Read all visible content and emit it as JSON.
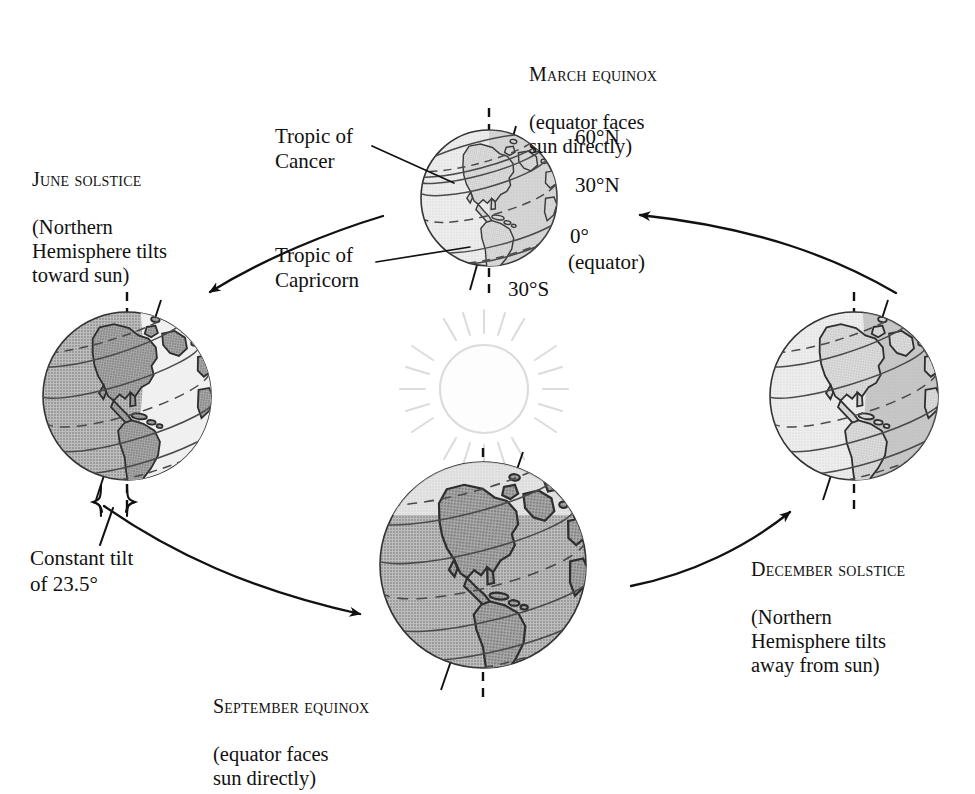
{
  "diagram": {
    "title_semantic": "earth-seasons-orbit-diagram",
    "center_body": "sun",
    "orbit_direction": "counterclockwise",
    "colors": {
      "ink": "#111111",
      "sun_outline": "#d8d8d8",
      "globe_light": "#e4e4e4",
      "globe_mid": "#c9c9c9",
      "globe_dark": "#9c9c9c",
      "land_light": "#d2d2d2",
      "land_dark": "#8f8f8f",
      "background": "#ffffff"
    }
  },
  "labels": {
    "march": {
      "heading": "March equinox",
      "detail": "(equator faces\nsun directly)"
    },
    "june": {
      "heading": "June solstice",
      "detail": "(Northern\nHemisphere tilts\ntoward sun)"
    },
    "september": {
      "heading": "September equinox",
      "detail": "(equator faces\nsun directly)"
    },
    "december": {
      "heading": "December solstice",
      "detail": "(Northern\nHemisphere tilts\naway from sun)"
    },
    "tropic_cancer": "Tropic of\nCancer",
    "tropic_capricorn": "Tropic of\nCapricorn",
    "tilt": "Constant tilt\nof 23.5°"
  },
  "latitude_ticks": [
    {
      "key": "n60",
      "text": "60°N"
    },
    {
      "key": "n30",
      "text": "30°N"
    },
    {
      "key": "eq",
      "text": "0°"
    },
    {
      "key": "eq_note",
      "text": "(equator)"
    },
    {
      "key": "s30",
      "text": "30°S"
    }
  ],
  "globes": [
    {
      "key": "march",
      "label": "March equinox globe",
      "lit_side": "both-even",
      "axis_tilt_deg": 23.5
    },
    {
      "key": "june",
      "label": "June solstice globe",
      "lit_side": "right",
      "axis_tilt_deg": 23.5
    },
    {
      "key": "september",
      "label": "September equinox globe",
      "lit_side": "both-even",
      "axis_tilt_deg": 23.5
    },
    {
      "key": "december",
      "label": "December solstice globe",
      "lit_side": "left",
      "axis_tilt_deg": 23.5
    }
  ],
  "orbit_arrows": [
    {
      "key": "march-to-june",
      "from": "March equinox",
      "to": "June solstice"
    },
    {
      "key": "june-to-september",
      "from": "June solstice",
      "to": "September equinox"
    },
    {
      "key": "september-to-december",
      "from": "September equinox",
      "to": "December solstice"
    },
    {
      "key": "december-to-march",
      "from": "December solstice",
      "to": "March equinox"
    }
  ]
}
